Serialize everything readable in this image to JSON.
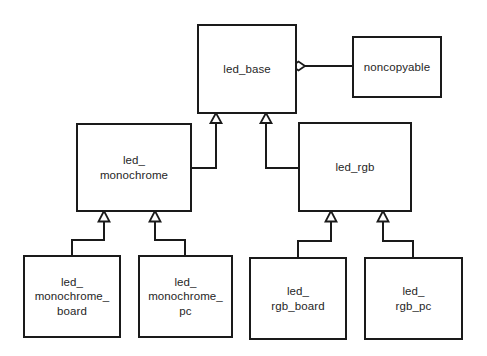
{
  "diagram": {
    "type": "uml-class-diagram",
    "background_color": "#ffffff",
    "line_color": "#1a1a1a",
    "text_color": "#262626",
    "classes": [
      {
        "id": "led_base",
        "label": "led_base",
        "x": 197,
        "y": 24,
        "w": 100,
        "h": 90
      },
      {
        "id": "noncopyable",
        "label": "noncopyable",
        "x": 352,
        "y": 36,
        "w": 90,
        "h": 62
      },
      {
        "id": "led_monochrome",
        "label": "led_\nmonochrome",
        "x": 76,
        "y": 123,
        "w": 116,
        "h": 89
      },
      {
        "id": "led_rgb",
        "label": "led_rgb",
        "x": 298,
        "y": 122,
        "w": 114,
        "h": 90
      },
      {
        "id": "led_monochrome_board",
        "label": "led_\nmonochrome_\nboard",
        "x": 23,
        "y": 255,
        "w": 98,
        "h": 83
      },
      {
        "id": "led_monochrome_pc",
        "label": "led_\nmonochrome_\npc",
        "x": 138,
        "y": 255,
        "w": 95,
        "h": 83
      },
      {
        "id": "led_rgb_board",
        "label": "led_\nrgb_board",
        "x": 249,
        "y": 257,
        "w": 98,
        "h": 83
      },
      {
        "id": "led_rgb_pc",
        "label": "led_\nrgb_pc",
        "x": 364,
        "y": 257,
        "w": 99,
        "h": 83
      }
    ],
    "relations": [
      {
        "kind": "aggregation",
        "from": "noncopyable",
        "to": "led_base",
        "marker": "hollow-diamond"
      },
      {
        "kind": "generalization",
        "from": "led_monochrome",
        "to": "led_base",
        "marker": "hollow-triangle"
      },
      {
        "kind": "generalization",
        "from": "led_rgb",
        "to": "led_base",
        "marker": "hollow-triangle"
      },
      {
        "kind": "generalization",
        "from": "led_monochrome_board",
        "to": "led_monochrome",
        "marker": "hollow-triangle"
      },
      {
        "kind": "generalization",
        "from": "led_monochrome_pc",
        "to": "led_monochrome",
        "marker": "hollow-triangle"
      },
      {
        "kind": "generalization",
        "from": "led_rgb_board",
        "to": "led_rgb",
        "marker": "hollow-triangle"
      },
      {
        "kind": "generalization",
        "from": "led_rgb_pc",
        "to": "led_rgb",
        "marker": "hollow-triangle"
      }
    ]
  }
}
